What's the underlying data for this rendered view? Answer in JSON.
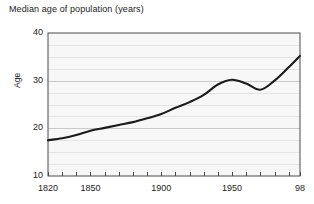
{
  "chart_data": {
    "type": "line",
    "title": "Median age of population (years)",
    "xlabel": "",
    "ylabel": "Age",
    "xlim": [
      1820,
      1998
    ],
    "ylim": [
      10,
      40
    ],
    "grid": true,
    "grid_interval": 2.5,
    "legend": null,
    "line_color": "#1a1a1a",
    "plot_background": "#f7f7f7",
    "xticks": [
      1820,
      1830,
      1840,
      1850,
      1860,
      1870,
      1880,
      1890,
      1900,
      1910,
      1920,
      1930,
      1940,
      1950,
      1960,
      1970,
      1980,
      1990,
      1998
    ],
    "xtick_labels": [
      {
        "value": 1820,
        "label": "1820"
      },
      {
        "value": 1850,
        "label": "1850"
      },
      {
        "value": 1900,
        "label": "1900"
      },
      {
        "value": 1950,
        "label": "1950"
      },
      {
        "value": 1998,
        "label": "98"
      }
    ],
    "yticks": [
      10,
      20,
      30,
      40
    ],
    "ytick_labels": [
      "10",
      "20",
      "30",
      "40"
    ],
    "series": [
      {
        "name": "Median age of population",
        "x": [
          1820,
          1830,
          1840,
          1850,
          1860,
          1870,
          1880,
          1890,
          1900,
          1910,
          1920,
          1930,
          1940,
          1950,
          1960,
          1970,
          1980,
          1990,
          1998
        ],
        "values": [
          17.5,
          17.9,
          18.6,
          19.5,
          20.1,
          20.7,
          21.3,
          22.1,
          23.0,
          24.3,
          25.5,
          27.0,
          29.2,
          30.2,
          29.4,
          28.1,
          30.0,
          32.8,
          35.2
        ]
      }
    ]
  }
}
